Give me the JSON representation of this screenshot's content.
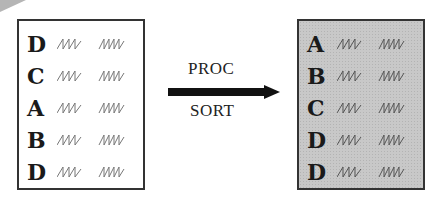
{
  "diagram": {
    "type": "process-flow",
    "input_dataset": {
      "rows": [
        {
          "key": "D"
        },
        {
          "key": "C"
        },
        {
          "key": "A"
        },
        {
          "key": "B"
        },
        {
          "key": "D"
        }
      ],
      "background": "#ffffff"
    },
    "process": {
      "label_top": "PROC",
      "label_bottom": "SORT",
      "arrow_color": "#111111"
    },
    "output_dataset": {
      "rows": [
        {
          "key": "A"
        },
        {
          "key": "B"
        },
        {
          "key": "C"
        },
        {
          "key": "D"
        },
        {
          "key": "D"
        }
      ],
      "background": "#c8c8c8"
    }
  }
}
